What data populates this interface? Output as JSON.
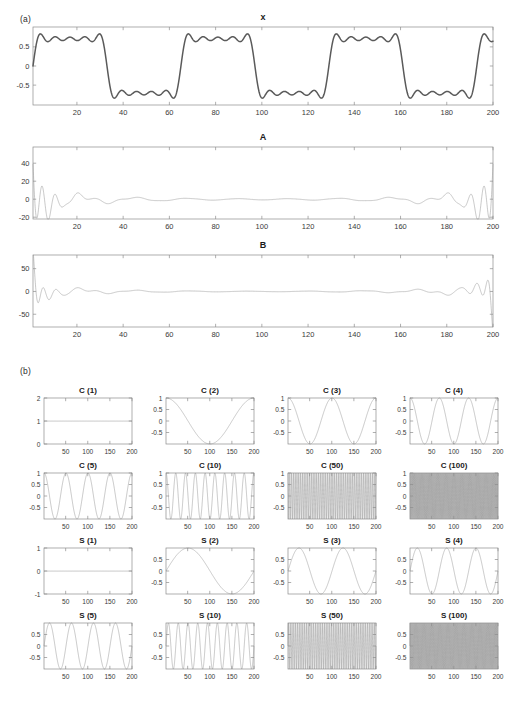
{
  "figure": {
    "panel_a_label": "(a)",
    "panel_b_label": "(b)"
  },
  "chart_data": [
    {
      "id": "x",
      "type": "line",
      "title": "x",
      "xlabel": "",
      "ylabel": "",
      "xlim": [
        1,
        200
      ],
      "xticks": [
        20,
        40,
        60,
        80,
        100,
        120,
        140,
        160,
        180,
        200
      ],
      "ylim": [
        -1.02,
        1.02
      ],
      "yticks": [
        -0.5,
        0,
        0.5
      ],
      "ytick_labels": [
        "-0.5",
        "0",
        "0.5"
      ],
      "grid": false,
      "description": "Band-limited square wave (partial Fourier sum) with Gibbs ripple, period 64 samples, 3 full cycles plus partial over x = 1..200",
      "waveform": "square_partial_fourier",
      "period": 64,
      "harmonics": 9,
      "amplitude": 0.9,
      "line_color": "#5a5a5a",
      "line_width": 1.5
    },
    {
      "id": "A",
      "type": "line",
      "title": "A",
      "xlabel": "",
      "ylabel": "",
      "xlim": [
        1,
        200
      ],
      "xticks": [
        20,
        40,
        60,
        80,
        100,
        120,
        140,
        160,
        180,
        200
      ],
      "ylim": [
        -22,
        58
      ],
      "yticks": [
        -20,
        0,
        20,
        40
      ],
      "ytick_labels": [
        "-20",
        "0",
        "20",
        "40"
      ],
      "grid": false,
      "description": "Cosine expansion coefficients: large spikes near both edges, near zero in the middle",
      "waveform": "edge_spikes",
      "line_color": "#9a9a9a",
      "line_width": 0.55
    },
    {
      "id": "B",
      "type": "line",
      "title": "B",
      "xlabel": "",
      "ylabel": "",
      "xlim": [
        1,
        200
      ],
      "xticks": [
        20,
        40,
        60,
        80,
        100,
        120,
        140,
        160,
        180,
        200
      ],
      "ylim": [
        -78,
        80
      ],
      "yticks": [
        -50,
        0,
        50
      ],
      "ytick_labels": [
        "-50",
        "0",
        "50"
      ],
      "grid": false,
      "description": "Sine expansion coefficients: large spikes near both edges, near zero in the middle",
      "waveform": "edge_spikes_b",
      "line_color": "#9a9a9a",
      "line_width": 0.55
    },
    {
      "id": "C1",
      "type": "line",
      "title": "C (1)",
      "basis": "cos",
      "k": 1,
      "xlim": [
        1,
        200
      ],
      "xticks": [
        50,
        100,
        150,
        200
      ],
      "ylim": [
        0,
        2
      ],
      "yticks": [
        0,
        1,
        2
      ],
      "ytick_labels": [
        "0",
        "1",
        "2"
      ],
      "constant": 1,
      "grid": false
    },
    {
      "id": "C2",
      "type": "line",
      "title": "C (2)",
      "basis": "cos",
      "k": 2,
      "xlim": [
        1,
        200
      ],
      "xticks": [
        50,
        100,
        150,
        200
      ],
      "ylim": [
        -1,
        1
      ],
      "yticks": [
        -0.5,
        0,
        0.5,
        1
      ],
      "ytick_labels": [
        "-0.5",
        "0",
        "0.5",
        "1"
      ],
      "cycles": 1,
      "grid": false
    },
    {
      "id": "C3",
      "type": "line",
      "title": "C (3)",
      "basis": "cos",
      "k": 3,
      "xlim": [
        1,
        200
      ],
      "xticks": [
        50,
        100,
        150,
        200
      ],
      "ylim": [
        -1,
        1
      ],
      "yticks": [
        -0.5,
        0,
        0.5,
        1
      ],
      "ytick_labels": [
        "-0.5",
        "0",
        "0.5",
        "1"
      ],
      "cycles": 2,
      "grid": false
    },
    {
      "id": "C4",
      "type": "line",
      "title": "C (4)",
      "basis": "cos",
      "k": 4,
      "xlim": [
        1,
        200
      ],
      "xticks": [
        50,
        100,
        150,
        200
      ],
      "ylim": [
        -1,
        1
      ],
      "yticks": [
        -0.5,
        0,
        0.5,
        1
      ],
      "ytick_labels": [
        "-0.5",
        "0",
        "0.5",
        "1"
      ],
      "cycles": 3,
      "grid": false
    },
    {
      "id": "C5",
      "type": "line",
      "title": "C (5)",
      "basis": "cos",
      "k": 5,
      "xlim": [
        1,
        200
      ],
      "xticks": [
        50,
        100,
        150,
        200
      ],
      "ylim": [
        -1,
        1
      ],
      "yticks": [
        -0.5,
        0,
        0.5,
        1
      ],
      "ytick_labels": [
        "-0.5",
        "0",
        "0.5",
        "1"
      ],
      "cycles": 4,
      "grid": false
    },
    {
      "id": "C10",
      "type": "line",
      "title": "C (10)",
      "basis": "cos",
      "k": 10,
      "xlim": [
        1,
        200
      ],
      "xticks": [
        50,
        100,
        150,
        200
      ],
      "ylim": [
        -1,
        1
      ],
      "yticks": [
        -0.5,
        0,
        0.5,
        1
      ],
      "ytick_labels": [
        "-0.5",
        "0",
        "0.5",
        "1"
      ],
      "cycles": 9,
      "grid": false
    },
    {
      "id": "C50",
      "type": "line",
      "title": "C (50)",
      "basis": "cos",
      "k": 50,
      "xlim": [
        1,
        200
      ],
      "xticks": [
        50,
        100,
        150,
        200
      ],
      "ylim": [
        -1,
        1
      ],
      "yticks": [
        -0.5,
        0,
        0.5,
        1
      ],
      "ytick_labels": [
        "-0.5",
        "0",
        "0.5",
        "1"
      ],
      "cycles": 49,
      "grid": false
    },
    {
      "id": "C100",
      "type": "line",
      "title": "C (100)",
      "basis": "cos",
      "k": 100,
      "xlim": [
        1,
        200
      ],
      "xticks": [
        50,
        100,
        150,
        200
      ],
      "ylim": [
        -1,
        1
      ],
      "yticks": [
        -0.5,
        0,
        0.5,
        1
      ],
      "ytick_labels": [
        "-0.5",
        "0",
        "0.5",
        "1"
      ],
      "cycles": 99,
      "grid": false,
      "beat_lobes": 3
    },
    {
      "id": "S1",
      "type": "line",
      "title": "S (1)",
      "basis": "sin",
      "k": 1,
      "xlim": [
        1,
        200
      ],
      "xticks": [
        50,
        100,
        150,
        200
      ],
      "ylim": [
        -1,
        1
      ],
      "yticks": [
        -1,
        0,
        1
      ],
      "ytick_labels": [
        "-1",
        "0",
        "1"
      ],
      "constant": 0,
      "grid": false
    },
    {
      "id": "S2",
      "type": "line",
      "title": "S (2)",
      "basis": "sin",
      "k": 2,
      "xlim": [
        1,
        200
      ],
      "xticks": [
        50,
        100,
        150,
        200
      ],
      "ylim": [
        -1,
        1
      ],
      "yticks": [
        -0.5,
        0,
        0.5
      ],
      "ytick_labels": [
        "-0.5",
        "0",
        "0.5"
      ],
      "cycles": 1,
      "grid": false
    },
    {
      "id": "S3",
      "type": "line",
      "title": "S (3)",
      "basis": "sin",
      "k": 3,
      "xlim": [
        1,
        200
      ],
      "xticks": [
        50,
        100,
        150,
        200
      ],
      "ylim": [
        -1,
        1
      ],
      "yticks": [
        -0.5,
        0,
        0.5
      ],
      "ytick_labels": [
        "-0.5",
        "0",
        "0.5"
      ],
      "cycles": 2,
      "grid": false
    },
    {
      "id": "S4",
      "type": "line",
      "title": "S (4)",
      "basis": "sin",
      "k": 4,
      "xlim": [
        1,
        200
      ],
      "xticks": [
        50,
        100,
        150,
        200
      ],
      "ylim": [
        -1,
        1
      ],
      "yticks": [
        -0.5,
        0,
        0.5
      ],
      "ytick_labels": [
        "-0.5",
        "0",
        "0.5"
      ],
      "cycles": 3,
      "grid": false
    },
    {
      "id": "S5",
      "type": "line",
      "title": "S (5)",
      "basis": "sin",
      "k": 5,
      "xlim": [
        1,
        200
      ],
      "xticks": [
        50,
        100,
        150,
        200
      ],
      "ylim": [
        -1,
        1
      ],
      "yticks": [
        -0.5,
        0,
        0.5
      ],
      "ytick_labels": [
        "-0.5",
        "0",
        "0.5"
      ],
      "cycles": 4,
      "grid": false
    },
    {
      "id": "S10",
      "type": "line",
      "title": "S (10)",
      "basis": "sin",
      "k": 10,
      "xlim": [
        1,
        200
      ],
      "xticks": [
        50,
        100,
        150,
        200
      ],
      "ylim": [
        -1,
        1
      ],
      "yticks": [
        -0.5,
        0,
        0.5
      ],
      "ytick_labels": [
        "-0.5",
        "0",
        "0.5"
      ],
      "cycles": 9,
      "grid": false
    },
    {
      "id": "S50",
      "type": "line",
      "title": "S (50)",
      "basis": "sin",
      "k": 50,
      "xlim": [
        1,
        200
      ],
      "xticks": [
        50,
        100,
        150,
        200
      ],
      "ylim": [
        -1,
        1
      ],
      "yticks": [
        -0.5,
        0,
        0.5
      ],
      "ytick_labels": [
        "-0.5",
        "0",
        "0.5"
      ],
      "cycles": 49,
      "grid": false
    },
    {
      "id": "S100",
      "type": "line",
      "title": "S (100)",
      "basis": "sin",
      "k": 100,
      "xlim": [
        1,
        200
      ],
      "xticks": [
        50,
        100,
        150,
        200
      ],
      "ylim": [
        -1,
        1
      ],
      "yticks": [
        -0.5,
        0,
        0.5
      ],
      "ytick_labels": [
        "-0.5",
        "0",
        "0.5"
      ],
      "cycles": 99,
      "grid": false,
      "beat_lobes": 3
    }
  ],
  "layout": {
    "big_panels": [
      {
        "id": "x",
        "x": 33,
        "y": 27,
        "w": 460,
        "h": 78
      },
      {
        "id": "A",
        "x": 33,
        "y": 147,
        "w": 460,
        "h": 72
      },
      {
        "id": "B",
        "x": 33,
        "y": 255,
        "w": 460,
        "h": 72
      }
    ],
    "grid_panels": [
      {
        "id": "C1",
        "col": 0,
        "row": 0
      },
      {
        "id": "C2",
        "col": 1,
        "row": 0
      },
      {
        "id": "C3",
        "col": 2,
        "row": 0
      },
      {
        "id": "C4",
        "col": 3,
        "row": 0
      },
      {
        "id": "C5",
        "col": 0,
        "row": 1
      },
      {
        "id": "C10",
        "col": 1,
        "row": 1
      },
      {
        "id": "C50",
        "col": 2,
        "row": 1
      },
      {
        "id": "C100",
        "col": 3,
        "row": 1
      },
      {
        "id": "S1",
        "col": 0,
        "row": 2
      },
      {
        "id": "S2",
        "col": 1,
        "row": 2
      },
      {
        "id": "S3",
        "col": 2,
        "row": 2
      },
      {
        "id": "S4",
        "col": 3,
        "row": 2
      },
      {
        "id": "S5",
        "col": 0,
        "row": 3
      },
      {
        "id": "S10",
        "col": 1,
        "row": 3
      },
      {
        "id": "S50",
        "col": 2,
        "row": 3
      },
      {
        "id": "S100",
        "col": 3,
        "row": 3
      }
    ],
    "grid_origin": {
      "x": 44,
      "y": 398
    },
    "grid_cell": {
      "w": 122,
      "h": 75
    },
    "grid_plot": {
      "w": 88,
      "h": 46
    }
  }
}
